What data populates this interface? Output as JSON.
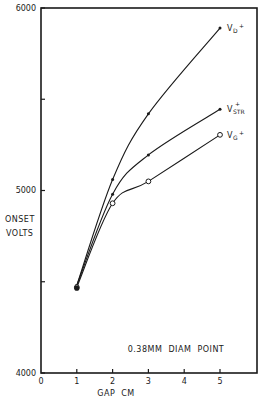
{
  "chart_data": {
    "type": "line",
    "title": "",
    "xlabel": "GAP  CM",
    "ylabel": "ONSET VOLTS",
    "xlim": [
      0,
      6
    ],
    "ylim": [
      4000,
      6000
    ],
    "x_ticks": [
      "0",
      "1",
      "2",
      "3",
      "4",
      "5"
    ],
    "y_ticks": [
      "4000",
      "5000",
      "6000"
    ],
    "y_minor_ticks": [
      4500,
      5500
    ],
    "grid": false,
    "annotation": "0.38MM  DIAM  POINT",
    "x": [
      1,
      2,
      3,
      5
    ],
    "series": [
      {
        "name": "V_D+",
        "label_main": "V",
        "label_sub": "D",
        "label_sup": "+",
        "marker": "dot",
        "values": [
          4480,
          5060,
          5420,
          5890
        ]
      },
      {
        "name": "V_STR+",
        "label_main": "V",
        "label_sub": "STR",
        "label_sup": "+",
        "marker": "dot",
        "values": [
          4480,
          4980,
          5195,
          5445
        ]
      },
      {
        "name": "V_G+",
        "label_main": "V",
        "label_sub": "G",
        "label_sup": "+",
        "marker": "open-circle",
        "values": [
          4470,
          4930,
          5050,
          5305
        ]
      }
    ]
  },
  "colors": {
    "ink": "#1a1a1a",
    "background": "#ffffff"
  }
}
